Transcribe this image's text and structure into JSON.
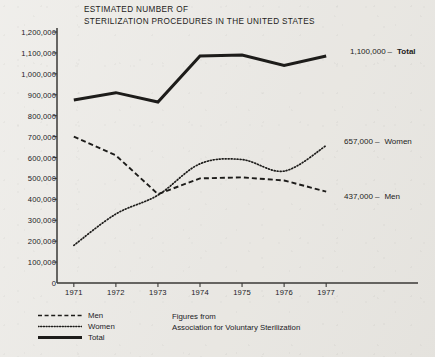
{
  "title": "ESTIMATED NUMBER OF\nSTERILIZATION PROCEDURES IN THE UNITED STATES",
  "source_note": "Figures from\nAssociation for Voluntary Sterilization",
  "legend": {
    "items": [
      {
        "label": "Men",
        "style": "dashed"
      },
      {
        "label": "Women",
        "style": "dotted"
      },
      {
        "label": "Total",
        "style": "solid"
      }
    ]
  },
  "end_labels": [
    {
      "value": "1,100,000",
      "dash": "–",
      "name": "Total"
    },
    {
      "value": "657,000",
      "dash": "–",
      "name": "Women"
    },
    {
      "value": "437,000",
      "dash": "–",
      "name": "Men"
    }
  ],
  "colors": {
    "background": "#e9e7e2",
    "ink": "#1d1c1a",
    "axis": "#3a3936"
  },
  "chart_data": {
    "type": "line",
    "title": "ESTIMATED NUMBER OF STERILIZATION PROCEDURES IN THE UNITED STATES",
    "xlabel": "",
    "ylabel": "",
    "x": [
      1971,
      1972,
      1973,
      1974,
      1975,
      1976,
      1977
    ],
    "categories": [
      "1971",
      "1972",
      "1973",
      "1974",
      "1975",
      "1976",
      "1977"
    ],
    "xlim": [
      1970.6,
      1977.4
    ],
    "ylim": [
      0,
      1200000
    ],
    "ytick_labels": [
      "0",
      "100,000",
      "200,000",
      "300,000",
      "400,000",
      "500,000",
      "600,000",
      "700,000",
      "800,000",
      "900,000",
      "1,000,000",
      "1,100,000",
      "1,200,000"
    ],
    "ytick_values": [
      0,
      100000,
      200000,
      300000,
      400000,
      500000,
      600000,
      700000,
      800000,
      900000,
      1000000,
      1100000,
      1200000
    ],
    "ytick_step": 100000,
    "grid": false,
    "legend_position": "bottom-left",
    "series": [
      {
        "name": "Men",
        "style": "dashed",
        "values": [
          700000,
          610000,
          425000,
          500000,
          505000,
          490000,
          437000
        ],
        "end_value": 437000,
        "end_label": "437,000 – Men"
      },
      {
        "name": "Women",
        "style": "dotted",
        "values": [
          180000,
          330000,
          420000,
          570000,
          590000,
          535000,
          657000
        ],
        "end_value": 657000,
        "end_label": "657,000 – Women"
      },
      {
        "name": "Total",
        "style": "solid",
        "values": [
          875000,
          910000,
          865000,
          1085000,
          1090000,
          1040000,
          1085000
        ],
        "end_value": 1100000,
        "end_label": "1,100,000 – Total"
      }
    ],
    "annotations": [
      "Figures from Association for Voluntary Sterilization"
    ]
  }
}
